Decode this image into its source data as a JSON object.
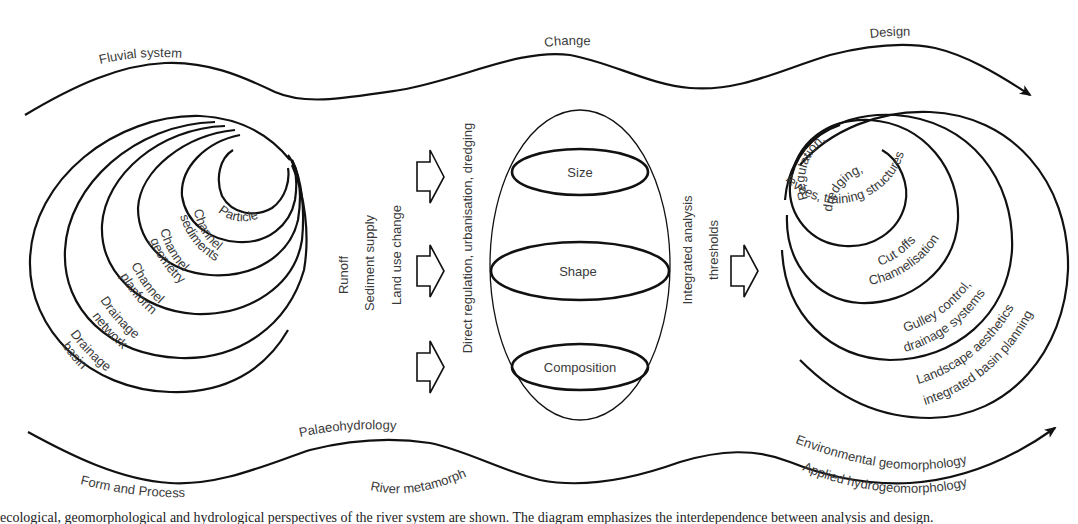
{
  "diagram": {
    "top_band": {
      "labels": [
        "Fluvial system",
        "Change",
        "Design"
      ]
    },
    "bottom_band": {
      "upper_labels": [
        "Palaeohydrology",
        "Environmental geomorphology"
      ],
      "lower_labels": [
        "Form and Process",
        "River metamorphosis",
        "Applied hydrogeomorphology"
      ]
    },
    "left_nested_scales": {
      "items": [
        "Particle",
        "Channel sediments",
        "Channel geometry",
        "Channel planform",
        "Drainage network",
        "Drainage basin"
      ],
      "line1": [
        "Particle",
        "Channel",
        "Channel",
        "Channel",
        "Drainage",
        "Drainage"
      ],
      "line2": [
        "",
        "sediments",
        "geometry",
        "planform",
        "network",
        "basin"
      ]
    },
    "drivers": {
      "items": [
        "Runoff",
        "Sediment supply",
        "Land use change"
      ],
      "direct": "Direct regulation, urbanisation, dredging"
    },
    "arrows": [
      "input-arrow-1",
      "input-arrow-2",
      "input-arrow-3",
      "output-arrow"
    ],
    "central_ellipse": {
      "sections": [
        "Size",
        "Shape",
        "Composition"
      ]
    },
    "analysis": {
      "line1": "Integrated analysis",
      "line2": "thresholds"
    },
    "right_nested_design": {
      "items": [
        "Regulation, dredging, levées, training structures",
        "Cut offs Channelisation",
        "Gulley control, drainage systems",
        "Landscape aesthetics integrated basin planning"
      ],
      "r1a": "Regulation,",
      "r1b": "dredging,",
      "r1c": "levées, training structures",
      "r2a": "Cut offs",
      "r2b": "Channelisation",
      "r3a": "Gulley control,",
      "r3b": "drainage systems",
      "r4a": "Landscape aesthetics",
      "r4b": "integrated basin planning"
    },
    "caption_fragment": "ecological, geomorphological and hydrological perspectives of the river system are shown. The diagram emphasizes the interdependence between analysis and design."
  }
}
